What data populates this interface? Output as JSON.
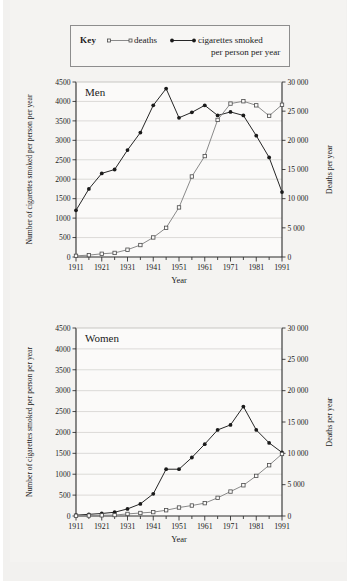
{
  "legend": {
    "key_word": "Key",
    "series": [
      {
        "name": "deaths",
        "label": "deaths",
        "marker": "open-square",
        "color": "#8a8a8a"
      },
      {
        "name": "cigarettes",
        "label_line1": "cigarettes smoked",
        "label_line2": "per person per year",
        "marker": "filled-circle",
        "color": "#262626"
      }
    ]
  },
  "chart_data": [
    {
      "type": "line",
      "panel": "men",
      "title": "Men",
      "xlabel": "Year",
      "ylabel": "Number of cigarettes smoked per person per year",
      "ylabel_right": "Deaths per year",
      "grid": true,
      "legend_position": "top-external",
      "x": [
        1911,
        1916,
        1921,
        1926,
        1931,
        1936,
        1941,
        1946,
        1951,
        1956,
        1961,
        1966,
        1971,
        1976,
        1981,
        1986,
        1991
      ],
      "xtick_labels": [
        "1911",
        "1921",
        "1931",
        "1941",
        "1951",
        "1961",
        "1971",
        "1981",
        "1991"
      ],
      "xlim": [
        1911,
        1991
      ],
      "ylim_left": [
        0,
        4500
      ],
      "ytick_labels_left": [
        "0",
        "500",
        "1000",
        "1500",
        "2000",
        "2500",
        "3000",
        "3500",
        "4000",
        "4500"
      ],
      "ylim_right": [
        0,
        30000
      ],
      "ytick_labels_right": [
        "0",
        "5 000",
        "10 000",
        "15 000",
        "20 000",
        "25 000",
        "30 000"
      ],
      "series": [
        {
          "name": "cigarettes smoked per person per year",
          "axis": "left",
          "marker": "filled-circle",
          "color": "#262626",
          "values": [
            1200,
            1750,
            2150,
            2250,
            2750,
            3200,
            3900,
            4330,
            3580,
            3720,
            3900,
            3640,
            3730,
            3640,
            3120,
            2560,
            1670
          ]
        },
        {
          "name": "deaths",
          "axis": "right",
          "marker": "open-square",
          "color": "#8a8a8a",
          "values": [
            200,
            320,
            550,
            700,
            1250,
            2050,
            3350,
            5000,
            8500,
            13800,
            17300,
            23500,
            26300,
            26700,
            26000,
            24200,
            26100
          ]
        }
      ]
    },
    {
      "type": "line",
      "panel": "women",
      "title": "Women",
      "xlabel": "Year",
      "ylabel": "Number of cigarettes smoked per person per year",
      "ylabel_right": "Deaths per year",
      "grid": true,
      "legend_position": "top-external",
      "x": [
        1911,
        1916,
        1921,
        1926,
        1931,
        1936,
        1941,
        1946,
        1951,
        1956,
        1961,
        1966,
        1971,
        1976,
        1981,
        1986,
        1991
      ],
      "xtick_labels": [
        "1911",
        "1921",
        "1931",
        "1941",
        "1951",
        "1961",
        "1971",
        "1981",
        "1991"
      ],
      "xlim": [
        1911,
        1991
      ],
      "ylim_left": [
        0,
        4500
      ],
      "ytick_labels_left": [
        "0",
        "500",
        "1000",
        "1500",
        "2000",
        "2500",
        "3000",
        "3500",
        "4000",
        "4500"
      ],
      "ylim_right": [
        0,
        30000
      ],
      "ytick_labels_right": [
        "0",
        "5 000",
        "10 000",
        "15 000",
        "20 000",
        "25 000",
        "30 000"
      ],
      "series": [
        {
          "name": "cigarettes smoked per person per year",
          "axis": "left",
          "marker": "filled-circle",
          "color": "#262626",
          "values": [
            20,
            40,
            60,
            90,
            170,
            290,
            530,
            1120,
            1120,
            1400,
            1720,
            2060,
            2180,
            2620,
            2060,
            1750,
            1520
          ]
        },
        {
          "name": "deaths",
          "axis": "right",
          "marker": "open-square",
          "color": "#8a8a8a",
          "values": [
            40,
            70,
            110,
            150,
            330,
            480,
            620,
            920,
            1350,
            1670,
            2050,
            2900,
            3900,
            4900,
            6400,
            8100,
            9900
          ]
        }
      ]
    }
  ]
}
